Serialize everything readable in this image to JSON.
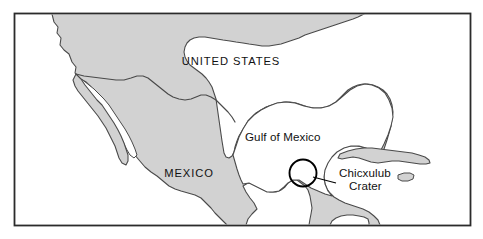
{
  "figure": {
    "type": "map",
    "title_present": false,
    "frame": {
      "stroke": "#2b2b2b",
      "fill": "#ffffff"
    },
    "colors": {
      "land": "#d2d2d2",
      "land_outline": "#4a4a4a",
      "border_line": "#4a4a4a",
      "water": "#ffffff",
      "text": "#111111",
      "crater_circle": "#000000",
      "leader_line": "#000000"
    }
  },
  "labels": {
    "united_states": "UNITED STATES",
    "mexico": "MEXICO",
    "gulf_of_mexico": "Gulf of Mexico",
    "chicxulub_line1": "Chicxulub",
    "chicxulub_line2": "Crater"
  },
  "features": {
    "landmasses": [
      "North America mainland",
      "Baja California peninsula",
      "Yucatan peninsula",
      "Cuba",
      "Jamaica"
    ],
    "water_bodies": [
      "Gulf of Mexico",
      "Gulf of California",
      "Pacific Ocean",
      "Caribbean Sea",
      "Atlantic Ocean"
    ],
    "political_borders": [
      "United States - Mexico border"
    ]
  },
  "annotation": {
    "name": "Chicxulub Crater",
    "marker_shape": "circle",
    "marker_center_x": 303,
    "marker_center_y": 173,
    "marker_radius": 13.5,
    "leader_from_x": 313,
    "leader_from_y": 177,
    "leader_to_x": 336,
    "leader_to_y": 183
  }
}
